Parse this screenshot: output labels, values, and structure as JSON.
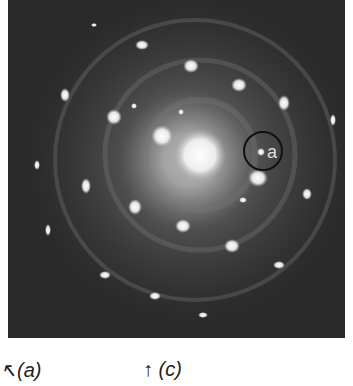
{
  "figure": {
    "background_color": "#2a2a2a",
    "spot_color": "#ffffff",
    "annotation": {
      "label": "a",
      "cx": 255,
      "cy": 151,
      "r": 19
    },
    "center": {
      "x": 200,
      "y": 155
    },
    "spots": [
      [
        86,
        25,
        3,
        2
      ],
      [
        134,
        45,
        7,
        5
      ],
      [
        183,
        66,
        8,
        7
      ],
      [
        231,
        85,
        8,
        7
      ],
      [
        57,
        95,
        5,
        7
      ],
      [
        276,
        103,
        6,
        8
      ],
      [
        106,
        117,
        8,
        8
      ],
      [
        126,
        106,
        3,
        3
      ],
      [
        173,
        112,
        3,
        3
      ],
      [
        154,
        136,
        11,
        11
      ],
      [
        253,
        152,
        4,
        4
      ],
      [
        29,
        165,
        3,
        5
      ],
      [
        78,
        186,
        5,
        8
      ],
      [
        250,
        178,
        10,
        9
      ],
      [
        299,
        194,
        5,
        6
      ],
      [
        127,
        207,
        7,
        8
      ],
      [
        175,
        226,
        8,
        7
      ],
      [
        224,
        246,
        8,
        7
      ],
      [
        97,
        275,
        6,
        4
      ],
      [
        271,
        265,
        6,
        4
      ],
      [
        147,
        296,
        6,
        4
      ],
      [
        195,
        315,
        5,
        3
      ],
      [
        325,
        120,
        3,
        6
      ],
      [
        40,
        230,
        3,
        6
      ],
      [
        235,
        200,
        4,
        3
      ]
    ]
  },
  "captions": [
    {
      "text": "↖(a)",
      "x": 0
    },
    {
      "text": "↑ (c)",
      "x": 143
    }
  ]
}
